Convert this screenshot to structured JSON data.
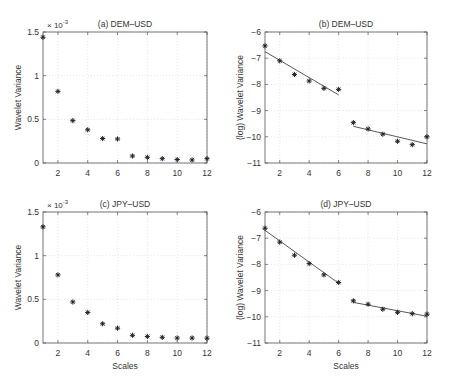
{
  "chart_data": [
    {
      "type": "scatter",
      "title": "(a) DEM–USD",
      "xlabel": "",
      "ylabel": "Wavelet Variance",
      "y_multiplier": "× 10",
      "y_exponent": "-3",
      "xlim": [
        1,
        12
      ],
      "ylim": [
        0,
        1.5
      ],
      "xticks": [
        2,
        4,
        6,
        8,
        10,
        12
      ],
      "yticks": [
        0,
        0.5,
        1,
        1.5
      ],
      "ytick_labels": [
        "0",
        "0.5",
        "1",
        "1.5"
      ],
      "grid": true,
      "marker": "*",
      "x": [
        1,
        2,
        3,
        4,
        5,
        6,
        7,
        8,
        9,
        10,
        11,
        12
      ],
      "values": [
        1.44,
        0.82,
        0.485,
        0.38,
        0.28,
        0.275,
        0.08,
        0.065,
        0.05,
        0.04,
        0.035,
        0.05
      ],
      "fit_lines": []
    },
    {
      "type": "scatter",
      "title": "(b) DEM–USD",
      "xlabel": "",
      "ylabel": "(log) Wavelet Variance",
      "xlim": [
        1,
        12
      ],
      "ylim": [
        -11,
        -6
      ],
      "xticks": [
        2,
        4,
        6,
        8,
        10,
        12
      ],
      "yticks": [
        -11,
        -10,
        -9,
        -8,
        -7,
        -6
      ],
      "ytick_labels": [
        "−11",
        "−10",
        "−9",
        "−8",
        "−7",
        "−6"
      ],
      "grid": true,
      "marker": "*",
      "x": [
        1,
        2,
        3,
        4,
        5,
        6,
        7,
        8,
        9,
        10,
        11,
        12
      ],
      "values": [
        -6.53,
        -7.1,
        -7.62,
        -7.87,
        -8.15,
        -8.19,
        -9.46,
        -9.7,
        -9.9,
        -10.17,
        -10.3,
        -10.0
      ],
      "fit_lines": [
        {
          "x": [
            1,
            6
          ],
          "y": [
            -6.75,
            -8.4
          ]
        },
        {
          "x": [
            7,
            12
          ],
          "y": [
            -9.6,
            -10.27
          ]
        }
      ]
    },
    {
      "type": "scatter",
      "title": "(c) JPY–USD",
      "xlabel": "Scales",
      "ylabel": "Wavelet Variance",
      "y_multiplier": "× 10",
      "y_exponent": "-3",
      "xlim": [
        1,
        12
      ],
      "ylim": [
        0,
        1.5
      ],
      "xticks": [
        2,
        4,
        6,
        8,
        10,
        12
      ],
      "yticks": [
        0,
        0.5,
        1,
        1.5
      ],
      "ytick_labels": [
        "0",
        "0.5",
        "1",
        "1.5"
      ],
      "grid": true,
      "marker": "*",
      "x": [
        1,
        2,
        3,
        4,
        5,
        6,
        7,
        8,
        9,
        10,
        11,
        12
      ],
      "values": [
        1.33,
        0.78,
        0.47,
        0.35,
        0.22,
        0.17,
        0.088,
        0.075,
        0.065,
        0.057,
        0.057,
        0.055
      ],
      "fit_lines": []
    },
    {
      "type": "scatter",
      "title": "(d) JPY–USD",
      "xlabel": "Scales",
      "ylabel": "(log) Wavelet Variance",
      "xlim": [
        1,
        12
      ],
      "ylim": [
        -11,
        -6
      ],
      "xticks": [
        2,
        4,
        6,
        8,
        10,
        12
      ],
      "yticks": [
        -11,
        -10,
        -9,
        -8,
        -7,
        -6
      ],
      "ytick_labels": [
        "−11",
        "−10",
        "−9",
        "−8",
        "−7",
        "−6"
      ],
      "grid": true,
      "marker": "*",
      "x": [
        1,
        2,
        3,
        4,
        5,
        6,
        7,
        8,
        9,
        10,
        11,
        12
      ],
      "values": [
        -6.62,
        -7.15,
        -7.65,
        -7.97,
        -8.4,
        -8.69,
        -9.39,
        -9.52,
        -9.71,
        -9.83,
        -9.88,
        -9.9
      ],
      "fit_lines": [
        {
          "x": [
            1,
            6
          ],
          "y": [
            -6.7,
            -8.72
          ]
        },
        {
          "x": [
            7,
            12
          ],
          "y": [
            -9.45,
            -9.98
          ]
        }
      ]
    }
  ],
  "layout": {
    "panels": [
      {
        "left": 43,
        "top": 32,
        "right": 207,
        "bottom": 163
      },
      {
        "left": 265,
        "top": 32,
        "right": 427,
        "bottom": 163
      },
      {
        "left": 43,
        "top": 212,
        "right": 207,
        "bottom": 343
      },
      {
        "left": 265,
        "top": 212,
        "right": 427,
        "bottom": 343
      }
    ]
  }
}
